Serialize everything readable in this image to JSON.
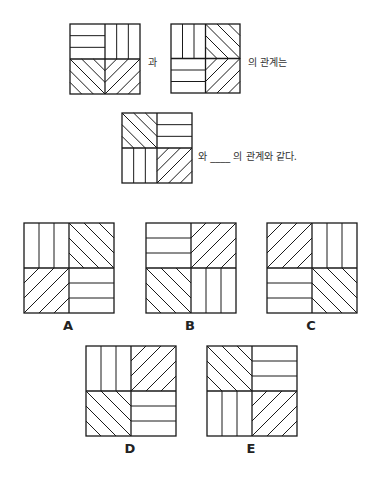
{
  "question": {
    "connector_1": "과",
    "connector_2": "의 관계는",
    "connector_3": "와 ____ 의 관계와 같다."
  },
  "figures": {
    "q1": {
      "x": 69,
      "y": 23,
      "size": 70,
      "quadrants": [
        "h",
        "v",
        "d1",
        "d2"
      ]
    },
    "q2": {
      "x": 170,
      "y": 23,
      "size": 69,
      "quadrants": [
        "v",
        "d1",
        "h",
        "d2"
      ]
    },
    "q3": {
      "x": 121,
      "y": 112,
      "size": 70,
      "quadrants": [
        "d1",
        "h",
        "v",
        "d2"
      ]
    }
  },
  "options": [
    {
      "label": "A",
      "x": 23,
      "y": 222,
      "size": 90,
      "quadrants": [
        "v",
        "d1",
        "d2",
        "h"
      ]
    },
    {
      "label": "B",
      "x": 145,
      "y": 222,
      "size": 90,
      "quadrants": [
        "h",
        "d2",
        "d1",
        "v"
      ]
    },
    {
      "label": "C",
      "x": 266,
      "y": 222,
      "size": 90,
      "quadrants": [
        "d2",
        "v",
        "h",
        "d1"
      ]
    },
    {
      "label": "D",
      "x": 85,
      "y": 345,
      "size": 90,
      "quadrants": [
        "v",
        "d2",
        "d1",
        "h"
      ]
    },
    {
      "label": "E",
      "x": 206,
      "y": 345,
      "size": 90,
      "quadrants": [
        "d1",
        "h",
        "v",
        "d2"
      ]
    }
  ],
  "legend": {
    "h": "horizontal-lines",
    "v": "vertical-lines",
    "d1": "diagonal-rising",
    "d2": "diagonal-falling"
  },
  "colors": {
    "stroke": "#1a1a1a",
    "background": "#ffffff"
  }
}
